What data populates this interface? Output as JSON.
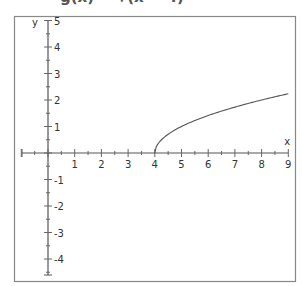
{
  "title": "g(x) = √(x − 4)",
  "chart_data": {
    "type": "line",
    "title": "g(x) = √(x − 4)",
    "xlabel": "x",
    "ylabel": "y",
    "xlim": [
      -1,
      9
    ],
    "ylim": [
      -5,
      5
    ],
    "x_ticks": [
      1,
      2,
      3,
      4,
      5,
      6,
      7,
      8,
      9
    ],
    "y_ticks": [
      5,
      4,
      3,
      2,
      1,
      -1,
      -2,
      -3,
      -4
    ],
    "grid": false,
    "series": [
      {
        "name": "g(x)",
        "x": [
          4,
          4.25,
          4.5,
          5,
          5.5,
          6,
          6.5,
          7,
          7.5,
          8,
          8.5,
          9
        ],
        "values": [
          0,
          0.5,
          0.71,
          1,
          1.22,
          1.41,
          1.58,
          1.73,
          1.87,
          2,
          2.12,
          2.24
        ]
      }
    ]
  }
}
